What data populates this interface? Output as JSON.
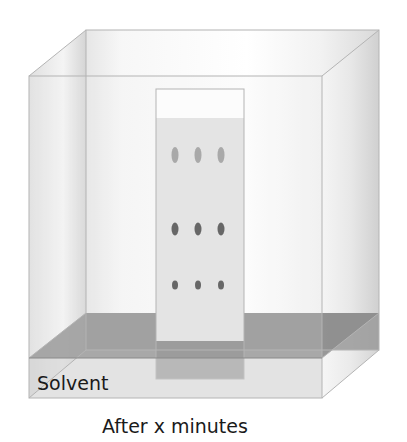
{
  "diagram": {
    "solvent_label": "Solvent",
    "caption": "After x minutes",
    "colors": {
      "glass_edge": "#b4b4b4",
      "glass_shade": "#d8d8d8",
      "solvent": "#8e8e8e",
      "plate": "#e2e2e2",
      "plate_dry": "#ffffff",
      "spot_light": "#9a9a9a",
      "spot_dark": "#4a4a4a",
      "text": "#1a1a1a"
    },
    "plate": {
      "lanes": 3,
      "spot_rows": [
        {
          "name": "top",
          "shade": "light"
        },
        {
          "name": "middle",
          "shade": "dark"
        },
        {
          "name": "bottom",
          "shade": "dark"
        }
      ]
    }
  }
}
